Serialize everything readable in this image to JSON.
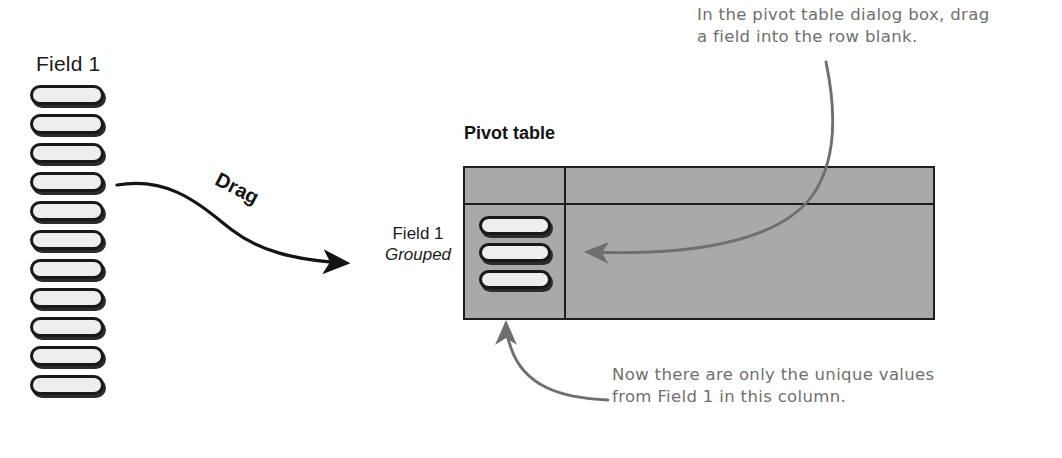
{
  "source": {
    "label": "Field 1",
    "pill_count": 11,
    "pill_name": "field-value-pill"
  },
  "drag": {
    "label": "Drag"
  },
  "dropped_field": {
    "name": "Field 1",
    "state": "Grouped"
  },
  "pivot": {
    "title": "Pivot table",
    "row_pill_count": 3,
    "fill_color": "#a9a9a9",
    "border_color": "#1d1d1d"
  },
  "annotations": {
    "top": "In the pivot table dialog box, drag\na field into the row blank.",
    "bottom": "Now there are only the unique values\nfrom Field 1 in this column.",
    "color": "#6f6f6f"
  },
  "icons": {
    "drag_arrow": "curved-arrow-icon",
    "callout_arrow_top": "curved-callout-arrow-icon",
    "callout_arrow_bottom": "curved-callout-arrow-icon"
  }
}
